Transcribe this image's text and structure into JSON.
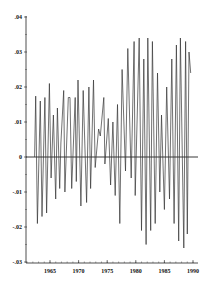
{
  "chart_data": {
    "type": "line",
    "title": "",
    "xlabel": "",
    "ylabel": "",
    "xlim": [
      1960.8,
      1990.6
    ],
    "ylim": [
      -0.03,
      0.04
    ],
    "grid": false,
    "legend": null,
    "x_ticks": [
      1965,
      1970,
      1975,
      1980,
      1985,
      1990
    ],
    "x_tick_labels": [
      "1965",
      "1970",
      "1975",
      "1980",
      "1985",
      "1990"
    ],
    "y_ticks": [
      0.04,
      0.03,
      0.02,
      0.01,
      0,
      -0.01,
      -0.02,
      -0.03
    ],
    "y_tick_labels": [
      ".04",
      ".03",
      ".02",
      ".01",
      "0",
      "-.01",
      "-.02",
      "-.03"
    ],
    "zero_line": true,
    "series": [
      {
        "name": "series",
        "x": [
          1962.3,
          1962.5,
          1962.8,
          1963.3,
          1963.6,
          1964.1,
          1964.4,
          1964.9,
          1965.2,
          1965.6,
          1966.0,
          1966.3,
          1966.7,
          1966.9,
          1967.4,
          1967.6,
          1968.2,
          1968.5,
          1968.8,
          1969.4,
          1969.6,
          1969.9,
          1970.4,
          1970.8,
          1971.4,
          1971.8,
          1972.1,
          1972.6,
          1972.9,
          1973.5,
          1973.8,
          1974.4,
          1974.6,
          1975.2,
          1975.6,
          1976.0,
          1976.4,
          1976.8,
          1977.2,
          1977.6,
          1978.2,
          1978.6,
          1979.2,
          1979.7,
          1979.9,
          1980.6,
          1981.0,
          1981.4,
          1981.8,
          1982.1,
          1982.6,
          1982.9,
          1983.4,
          1983.8,
          1984.2,
          1984.5,
          1985.0,
          1985.4,
          1985.9,
          1986.3,
          1986.7,
          1987.1,
          1987.5,
          1987.8,
          1988.4,
          1988.7,
          1989.0,
          1989.3,
          1989.6
        ],
        "y": [
          0.0,
          0.0174,
          -0.019,
          0.016,
          -0.017,
          0.017,
          -0.016,
          0.021,
          -0.006,
          0.012,
          -0.012,
          0.014,
          -0.009,
          0.004,
          0.019,
          -0.01,
          0.017,
          0.017,
          -0.009,
          0.017,
          -0.007,
          0.022,
          -0.014,
          0.019,
          -0.013,
          0.02,
          -0.009,
          0.022,
          -0.003,
          0.008,
          0.006,
          0.017,
          -0.002,
          0.011,
          -0.008,
          0.01,
          -0.011,
          0.015,
          -0.019,
          0.025,
          -0.004,
          0.031,
          -0.006,
          0.033,
          -0.011,
          0.034,
          -0.021,
          0.028,
          -0.025,
          0.034,
          -0.021,
          0.033,
          -0.019,
          0.024,
          -0.01,
          0.012,
          -0.015,
          0.02,
          -0.012,
          0.028,
          -0.019,
          0.032,
          -0.024,
          0.034,
          -0.026,
          0.033,
          -0.022,
          0.03,
          0.024
        ]
      }
    ]
  }
}
